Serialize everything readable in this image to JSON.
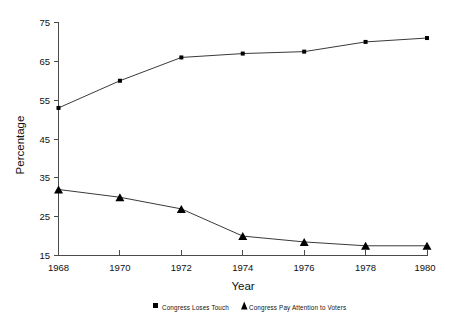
{
  "chart_data": {
    "type": "line",
    "title": "",
    "xlabel": "Year",
    "ylabel": "Percentage",
    "x": [
      1968,
      1970,
      1972,
      1974,
      1976,
      1978,
      1980
    ],
    "xtick_labels": [
      "1968",
      "1970",
      "1972",
      "1974",
      "1976",
      "1978",
      "1980"
    ],
    "ytick_labels": [
      "75",
      "65",
      "55",
      "45",
      "35",
      "25",
      "15"
    ],
    "yticks": [
      75,
      65,
      55,
      45,
      35,
      25,
      15
    ],
    "xlim": [
      1968,
      1980
    ],
    "ylim": [
      15,
      75
    ],
    "grid": false,
    "legend_position": "bottom",
    "series": [
      {
        "name": "Congress  Loses Touch",
        "marker": "square",
        "color": "#000000",
        "values": [
          53,
          60,
          66,
          67,
          67.5,
          70,
          71
        ]
      },
      {
        "name": "Congress  Pay Attention to Voters",
        "marker": "triangle",
        "color": "#000000",
        "values": [
          32,
          30,
          27,
          20,
          18.5,
          17.5,
          17.5
        ]
      }
    ]
  },
  "axes": {
    "y_title": "Percentage",
    "x_title": "Year",
    "y_ticks": [
      {
        "label": "75"
      },
      {
        "label": "65"
      },
      {
        "label": "55"
      },
      {
        "label": "45"
      },
      {
        "label": "35"
      },
      {
        "label": "25"
      },
      {
        "label": "15"
      }
    ],
    "x_ticks": [
      {
        "label": "1968"
      },
      {
        "label": "1970"
      },
      {
        "label": "1972"
      },
      {
        "label": "1974"
      },
      {
        "label": "1976"
      },
      {
        "label": "1978"
      },
      {
        "label": "1980"
      }
    ]
  },
  "legend": {
    "entries": [
      {
        "label": "Congress  Loses Touch",
        "marker": "square-marker-icon"
      },
      {
        "label": "Congress  Pay Attention to Voters",
        "marker": "triangle-marker-icon"
      }
    ]
  }
}
